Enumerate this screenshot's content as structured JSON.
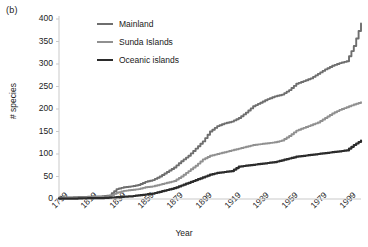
{
  "figure": {
    "panel_label": "(b)",
    "background": "#ffffff"
  },
  "chart_data": {
    "type": "line",
    "title": "",
    "panel": "(b)",
    "xlabel": "Year",
    "ylabel": "# species",
    "xlim": [
      1799,
      2009
    ],
    "ylim": [
      0,
      400
    ],
    "xticks": [
      1799,
      1819,
      1839,
      1859,
      1879,
      1899,
      1919,
      1939,
      1959,
      1979,
      1999
    ],
    "yticks": [
      0,
      50,
      100,
      150,
      200,
      250,
      300,
      350,
      400
    ],
    "grid": false,
    "legend_position": "top-left-inside",
    "x": [
      1799,
      1809,
      1819,
      1829,
      1834,
      1839,
      1844,
      1849,
      1854,
      1859,
      1864,
      1869,
      1874,
      1879,
      1884,
      1889,
      1894,
      1899,
      1904,
      1909,
      1914,
      1919,
      1924,
      1929,
      1934,
      1939,
      1944,
      1949,
      1954,
      1959,
      1964,
      1969,
      1974,
      1979,
      1984,
      1989,
      1994,
      1999,
      2004,
      2009
    ],
    "series": [
      {
        "name": "Mainland",
        "color": "#6e6e6e",
        "values": [
          3,
          4,
          5,
          6,
          8,
          22,
          26,
          28,
          31,
          38,
          42,
          50,
          60,
          70,
          84,
          96,
          112,
          128,
          150,
          162,
          168,
          172,
          180,
          192,
          206,
          214,
          222,
          228,
          232,
          242,
          256,
          262,
          268,
          278,
          288,
          296,
          302,
          306,
          340,
          390
        ],
        "final_value": 390
      },
      {
        "name": "Sunda Islands",
        "color": "#909090",
        "values": [
          2,
          3,
          4,
          5,
          6,
          14,
          18,
          20,
          22,
          26,
          28,
          32,
          36,
          40,
          50,
          62,
          74,
          88,
          96,
          100,
          104,
          108,
          112,
          116,
          120,
          122,
          124,
          126,
          130,
          140,
          152,
          158,
          164,
          170,
          180,
          190,
          198,
          204,
          210,
          215
        ],
        "final_value": 215
      },
      {
        "name": "Oceanic islands",
        "color": "#2b2b2b",
        "values": [
          1,
          1,
          2,
          2,
          3,
          4,
          5,
          6,
          8,
          10,
          12,
          16,
          20,
          24,
          30,
          36,
          42,
          48,
          54,
          58,
          60,
          62,
          72,
          74,
          76,
          78,
          80,
          82,
          86,
          90,
          94,
          96,
          98,
          100,
          102,
          104,
          106,
          108,
          120,
          130
        ],
        "final_value": 130
      }
    ]
  },
  "legend": {
    "items": [
      {
        "label": "Mainland",
        "color": "#6e6e6e",
        "thickness": 2
      },
      {
        "label": "Sunda Islands",
        "color": "#909090",
        "thickness": 2
      },
      {
        "label": "Oceanic islands",
        "color": "#2b2b2b",
        "thickness": 2.4
      }
    ]
  },
  "axes": {
    "y_tick_labels": [
      "400",
      "350",
      "300",
      "250",
      "200",
      "150",
      "100",
      "50",
      "0"
    ],
    "x_tick_labels": [
      "1799",
      "1819",
      "1839",
      "1859",
      "1879",
      "1899",
      "1919",
      "1939",
      "1959",
      "1979",
      "1999"
    ],
    "axis_color": "#c9c9c9"
  }
}
